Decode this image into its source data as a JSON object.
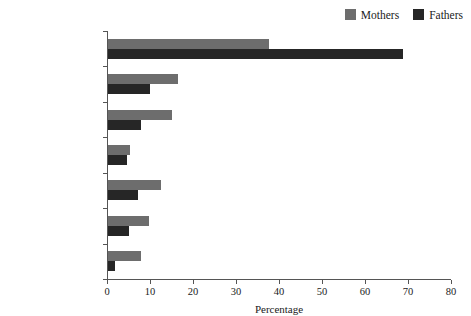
{
  "legend": {
    "position": "top-right",
    "entries": [
      {
        "label": "Mothers",
        "color": "#6d6d6d",
        "swatch_name": "legend-swatch-mothers"
      },
      {
        "label": "Fathers",
        "color": "#262626",
        "swatch_name": "legend-swatch-fathers"
      }
    ]
  },
  "axes": {
    "x_title": "Percentage",
    "x_ticks": [
      "0",
      "10",
      "20",
      "30",
      "40",
      "50",
      "60",
      "70",
      "80"
    ]
  },
  "chart_data": {
    "type": "bar",
    "orientation": "horizontal",
    "title": "",
    "xlabel": "Percentage",
    "ylabel": "",
    "xlim": [
      0,
      80
    ],
    "xticks": [
      0,
      10,
      20,
      30,
      40,
      50,
      60,
      70,
      80
    ],
    "grid": false,
    "legend_position": "top-right",
    "categories": [
      "Never",
      "Once or twice a year",
      "Every few months",
      "Once a month",
      "Several times a month",
      "About once a week",
      "Daily or almost daily"
    ],
    "series": [
      {
        "name": "Mothers",
        "color": "#6d6d6d",
        "values": [
          37.4,
          16.3,
          14.9,
          5.1,
          12.3,
          9.5,
          7.7
        ]
      },
      {
        "name": "Fathers",
        "color": "#262626",
        "values": [
          68.6,
          9.8,
          7.7,
          4.4,
          7.0,
          4.8,
          1.7
        ]
      }
    ]
  }
}
